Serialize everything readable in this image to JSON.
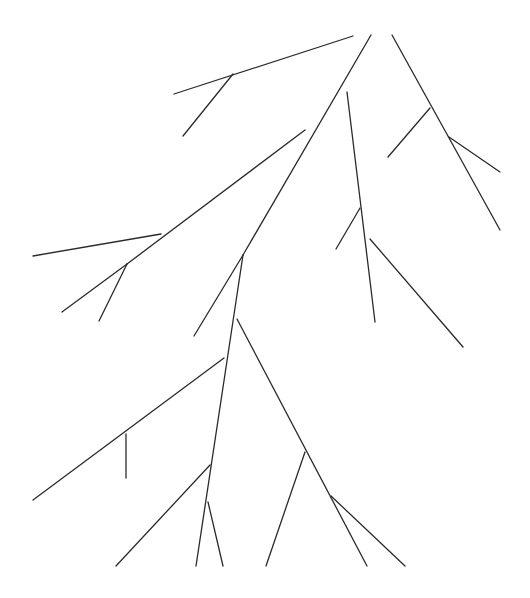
{
  "diagram": {
    "type": "branching-tree-line-drawing",
    "background": "#ffffff",
    "stroke_color": "#2a2a2a",
    "width": 530,
    "height": 598,
    "segments": [
      {
        "id": "top-left-branch",
        "x1": 174,
        "y1": 94,
        "x2": 353,
        "y2": 36
      },
      {
        "id": "top-left-twig",
        "x1": 233,
        "y1": 74,
        "x2": 183,
        "y2": 136
      },
      {
        "id": "trunk-upper",
        "x1": 371,
        "y1": 35,
        "x2": 243,
        "y2": 255
      },
      {
        "id": "trunk-upper-left",
        "x1": 243,
        "y1": 255,
        "x2": 194,
        "y2": 336
      },
      {
        "id": "right-arm",
        "x1": 392,
        "y1": 35,
        "x2": 500,
        "y2": 230
      },
      {
        "id": "right-arm-twig-left",
        "x1": 430,
        "y1": 108,
        "x2": 388,
        "y2": 157
      },
      {
        "id": "right-arm-twig-right",
        "x1": 449,
        "y1": 137,
        "x2": 500,
        "y2": 172
      },
      {
        "id": "mid-vertical",
        "x1": 347,
        "y1": 92,
        "x2": 375,
        "y2": 322
      },
      {
        "id": "mid-vertical-twig",
        "x1": 360,
        "y1": 208,
        "x2": 336,
        "y2": 249
      },
      {
        "id": "mid-right-diagonal",
        "x1": 370,
        "y1": 239,
        "x2": 463,
        "y2": 347
      },
      {
        "id": "left-arm",
        "x1": 305,
        "y1": 130,
        "x2": 127,
        "y2": 264
      },
      {
        "id": "left-arm-end",
        "x1": 127,
        "y1": 264,
        "x2": 62,
        "y2": 312
      },
      {
        "id": "left-arm-horizontal",
        "x1": 161,
        "y1": 234,
        "x2": 33,
        "y2": 256
      },
      {
        "id": "left-arm-twig",
        "x1": 127,
        "y1": 264,
        "x2": 99,
        "y2": 321
      },
      {
        "id": "trunk-lower",
        "x1": 243,
        "y1": 255,
        "x2": 196,
        "y2": 566
      },
      {
        "id": "right-lower-branch",
        "x1": 237,
        "y1": 319,
        "x2": 367,
        "y2": 566
      },
      {
        "id": "right-lower-twig-a",
        "x1": 305,
        "y1": 452,
        "x2": 266,
        "y2": 566
      },
      {
        "id": "right-lower-twig-b",
        "x1": 331,
        "y1": 496,
        "x2": 405,
        "y2": 566
      },
      {
        "id": "left-lower-branch",
        "x1": 224,
        "y1": 358,
        "x2": 33,
        "y2": 500
      },
      {
        "id": "left-lower-vertical",
        "x1": 126,
        "y1": 434,
        "x2": 126,
        "y2": 478
      },
      {
        "id": "bottom-left-branch",
        "x1": 210,
        "y1": 465,
        "x2": 116,
        "y2": 566
      },
      {
        "id": "bottom-mid-twig",
        "x1": 208,
        "y1": 502,
        "x2": 223,
        "y2": 566
      }
    ]
  }
}
